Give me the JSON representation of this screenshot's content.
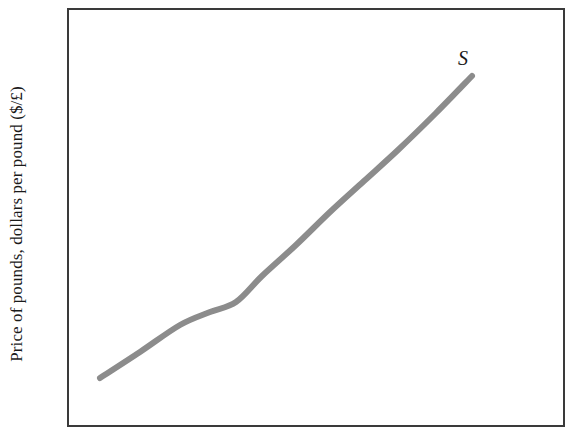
{
  "figure": {
    "background_color": "#ffffff",
    "axis_color": "#3a3a3a",
    "curve_color": "#8c8c8c"
  },
  "axes": {
    "y_title": "Price of pounds, dollars per pound ($/£)",
    "x_title": "",
    "frame": {
      "left": 68,
      "top": 9,
      "right": 564,
      "bottom": 426
    }
  },
  "annotations": {
    "supply_label": "S"
  },
  "chart_data": {
    "type": "line",
    "title": "",
    "xlabel": "",
    "ylabel": "Price of pounds, dollars per pound ($/£)",
    "grid": false,
    "legend": "none",
    "xlim": [
      0,
      569
    ],
    "ylim": [
      448,
      0
    ],
    "series": [
      {
        "name": "S",
        "label": "S",
        "color": "#8c8c8c",
        "linewidth": 6,
        "points": [
          [
            100,
            378
          ],
          [
            140,
            352
          ],
          [
            180,
            325
          ],
          [
            210,
            312
          ],
          [
            236,
            302
          ],
          [
            262,
            276
          ],
          [
            296,
            245
          ],
          [
            330,
            212
          ],
          [
            364,
            181
          ],
          [
            398,
            150
          ],
          [
            436,
            113
          ],
          [
            472,
            76
          ]
        ],
        "annotation": {
          "text": "S",
          "x": 466,
          "y": 60
        }
      }
    ]
  }
}
